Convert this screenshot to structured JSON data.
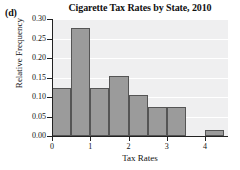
{
  "panel": {
    "label": "(d)"
  },
  "chart_data": {
    "type": "bar",
    "title": "Cigarette Tax Rates by State, 2010",
    "xlabel": "Tax Rates",
    "ylabel": "Relative Frequency",
    "xlim": [
      0,
      4.6
    ],
    "ylim": [
      0.0,
      0.3
    ],
    "grid": true,
    "legend": false,
    "bin_width": 0.5,
    "xticks": [
      "0",
      "1",
      "2",
      "3",
      "4"
    ],
    "xtick_values": [
      0,
      1,
      2,
      3,
      4
    ],
    "yticks": [
      "0.00",
      "0.05",
      "0.10",
      "0.15",
      "0.20",
      "0.25",
      "0.30"
    ],
    "ytick_values": [
      0.0,
      0.05,
      0.1,
      0.15,
      0.2,
      0.25,
      0.3
    ],
    "bins": [
      {
        "left": 0.0,
        "right": 0.5,
        "value": 0.123
      },
      {
        "left": 0.5,
        "right": 1.0,
        "value": 0.276
      },
      {
        "left": 1.0,
        "right": 1.5,
        "value": 0.123
      },
      {
        "left": 1.5,
        "right": 2.0,
        "value": 0.155
      },
      {
        "left": 2.0,
        "right": 2.5,
        "value": 0.105
      },
      {
        "left": 2.5,
        "right": 3.0,
        "value": 0.074
      },
      {
        "left": 3.0,
        "right": 3.5,
        "value": 0.074
      },
      {
        "left": 4.0,
        "right": 4.5,
        "value": 0.016
      }
    ],
    "colors": {
      "bar_fill": "#9b9b9b",
      "bar_edge": "#555555",
      "plot_background": "#efeff0",
      "gridline": "#ffffff",
      "axis": "#222222",
      "text": "#111111"
    }
  }
}
